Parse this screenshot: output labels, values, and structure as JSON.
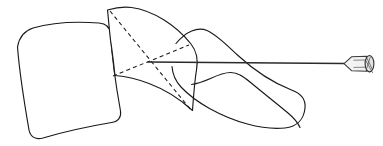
{
  "figure": {
    "title": "Lateral vertebral line drawing with transpedicular needle",
    "caption": "",
    "background_color": "#ffffff",
    "line_color": "#1a1a1a",
    "canvas": {
      "width": 383,
      "height": 146
    }
  },
  "chart_data": {
    "type": "diagram",
    "title": "Lateral vertebral line drawing with transpedicular needle",
    "xlabel": "",
    "ylabel": "",
    "xlim": [
      0,
      383
    ],
    "ylim": [
      0,
      146
    ],
    "grid": false,
    "legend": "none",
    "shapes": [
      {
        "name": "vertebral-body",
        "role": "anterior vertebral body",
        "style": "solid",
        "path": "M 17.5 47 C 19 38 24 31 33 28 C 52 22.5 78 21.5 99 23 C 106 23.5 110 27 110.5 34 C 112 58 116 86 120.5 111 C 121.5 117 118.5 121.5 111.5 122.5 C 88 126.5 63 132 43 138 C 35.5 140 30.5 137 29 130 C 24.5 104 19.5 73 17.5 47 Z"
      },
      {
        "name": "pedicle",
        "role": "pedicle seen end-on, with crossing diagonals",
        "style": "solid",
        "path": "M 107.5 10 C 116 7.5 124 6.5 131.5 7.5 C 153 10.5 176 25 191 44 C 197 51.5 198.5 59 196.5 70 C 194.5 82 193.5 96.5 192.5 110.5 C 180 99 165 89.5 149 83.5 C 137.5 79 126 76.5 115 75.5 C 114 66 112.5 53 110.5 40 C 109.5 31 108.5 19.5 107.5 10 Z"
      },
      {
        "name": "posterior-elements",
        "role": "lamina / transverse process silhouette",
        "style": "solid",
        "path": "M 176 43.5 C 186 31.5 197.5 26.5 207 30.5 C 216.5 34.5 226 44.5 238 55.5 C 256 72 276 84 291.5 90 C 301 93.5 306 99 305 108 C 304 119 297 126.5 285 128 C 262 130.5 233 121.5 209.5 108.5 C 198 102 188 94.5 181 87 C 175.5 81 172.5 74 172 66.5"
      },
      {
        "name": "posterior-elements-lower-edge",
        "role": "inferior margin of posterior elements",
        "style": "solid",
        "path": "M 191.5 84.5 C 198 83.5 204 81.5 210.5 78.5 C 218 75 224 72.5 230.5 72.5 C 238 72.5 243.5 76.5 250 82 C 262 92 276 103 288 113 C 294 118 298 123 300 127.5"
      }
    ],
    "guides": [
      {
        "name": "pedicle-diagonal-a",
        "style": "dashed",
        "from": [
          110,
          11
        ],
        "to": [
          191,
          110
        ],
        "note": "superolateral to inferomedial pedicle diagonal"
      },
      {
        "name": "pedicle-diagonal-b",
        "style": "dashed",
        "from": [
          113,
          76
        ],
        "to": [
          189,
          45
        ],
        "note": "inferolateral to superomedial pedicle diagonal"
      }
    ],
    "needle": {
      "name": "transpedicular-needle",
      "entry_point": [
        148,
        62
      ],
      "shaft_from": [
        147.5,
        62
      ],
      "shaft_to": [
        344,
        63.5
      ],
      "hub_from_x": 344,
      "hub_to_x": 374,
      "hub_center_y": 63.5,
      "note": "needle tip seated at the intersection of the two dashed pedicle diagonals"
    },
    "annotations": [],
    "labels": []
  }
}
